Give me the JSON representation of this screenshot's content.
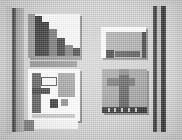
{
  "screenshot": {
    "width": 182,
    "height": 140,
    "description": "Low-resolution grayscale thumbnail grid of four window previews",
    "background_color": "#d2d2d2"
  },
  "palette": {
    "page_background": "#d2d2d2",
    "panel_white": "#fbfbfb",
    "mid_gray": "#9d9d9d",
    "dark_gray": "#3a3a3a",
    "near_black": "#2a2a2a",
    "edge_bar_dark": "#2e2e2e",
    "edge_bar_light": "#bcbcbc"
  },
  "edges": {
    "left": {
      "label": "left-margin-bars",
      "bars": [
        {
          "name": "outer-light",
          "color": "#c6c6c6"
        },
        {
          "name": "dark-rule",
          "color": "#3a3a3a"
        },
        {
          "name": "gray-rule",
          "color": "#aaaaaa"
        }
      ]
    },
    "right": {
      "label": "right-margin-bars",
      "bars": [
        {
          "name": "dark-rule-1",
          "color": "#2e2e2e"
        },
        {
          "name": "light-gap",
          "color": "#bcbcbc"
        },
        {
          "name": "dark-rule-2",
          "color": "#262626"
        },
        {
          "name": "outer-light",
          "color": "#d8d8d8"
        }
      ]
    }
  },
  "grid": {
    "label": "thumbnail-grid",
    "columns": 2,
    "rows": 2,
    "items": [
      {
        "id": "tl",
        "position": "top-left",
        "label": "staircase-chart-thumbnail",
        "background": "#fafafa",
        "foreground": "#2f2f2f",
        "shape": "descending-step-staircase"
      },
      {
        "id": "tr",
        "position": "top-right",
        "label": "window-preview-thumbnail",
        "background": "#ffffff",
        "foreground": "#a9a9a9",
        "shape": "window-with-toolbar-strip"
      },
      {
        "id": "bl",
        "position": "bottom-left",
        "label": "multi-pane-window-thumbnail",
        "background": "#ffffff",
        "foreground": "#5a5a5a",
        "shape": "panes-and-blocks",
        "caption_strip": true
      },
      {
        "id": "br",
        "position": "bottom-right",
        "label": "image-preview-thumbnail",
        "background": "#9d9d9d",
        "foreground": "#575757",
        "shape": "vertical-column-with-crossbar",
        "footer_bar": "#2a2a2a"
      }
    ]
  }
}
